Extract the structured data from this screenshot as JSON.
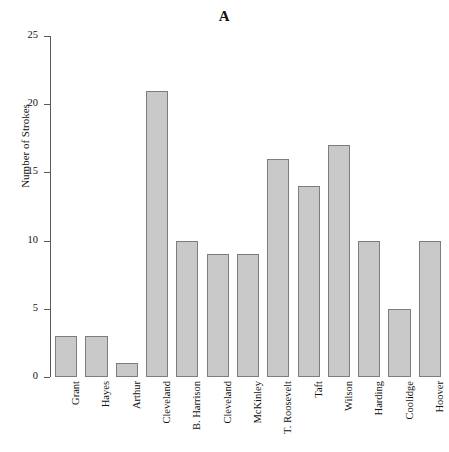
{
  "chart_data": {
    "type": "bar",
    "title": "A",
    "xlabel": "",
    "ylabel": "Number of Strokes",
    "categories": [
      "Grant",
      "Hayes",
      "Arthur",
      "Cleveland",
      "B. Harrison",
      "Cleveland",
      "McKinley",
      "T. Roosevelt",
      "Taft",
      "Wilson",
      "Harding",
      "Coolidge",
      "Hoover"
    ],
    "values": [
      3,
      3,
      1,
      21,
      10,
      9,
      9,
      16,
      14,
      17,
      10,
      5,
      10
    ],
    "ylim": [
      0,
      25
    ],
    "yticks": [
      0,
      5,
      10,
      15,
      20,
      25
    ],
    "ytick_labels": [
      "0",
      "5",
      "10",
      "15",
      "20",
      "25"
    ],
    "grid": false,
    "legend": null,
    "bar_color": "#c9c9c9",
    "bar_edge_color": "#7d7d7d",
    "axis_color": "#5a5a5a"
  }
}
